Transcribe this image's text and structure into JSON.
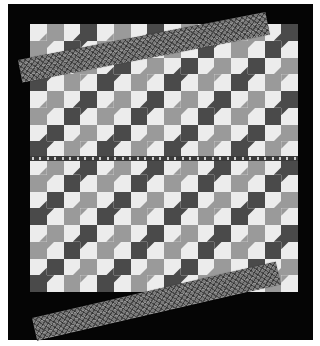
{
  "image": {
    "subject": "Bow tie quilt top photographed on black background",
    "colors": {
      "background": "#050505",
      "light_patch": "#ececec",
      "medium_patch": "#9a9a9a",
      "dark_patch": "#4a4a4a",
      "strip_base": "#7a7a7a",
      "ruler": "#3a3a3a"
    },
    "quilt": {
      "columns": 16,
      "rows": 16
    },
    "ruler": {
      "ticks": 36
    },
    "strips": [
      {
        "position": "top",
        "description": "plaid binding strip laid diagonally across top"
      },
      {
        "position": "bottom",
        "description": "plaid binding strip laid diagonally across bottom"
      }
    ]
  }
}
